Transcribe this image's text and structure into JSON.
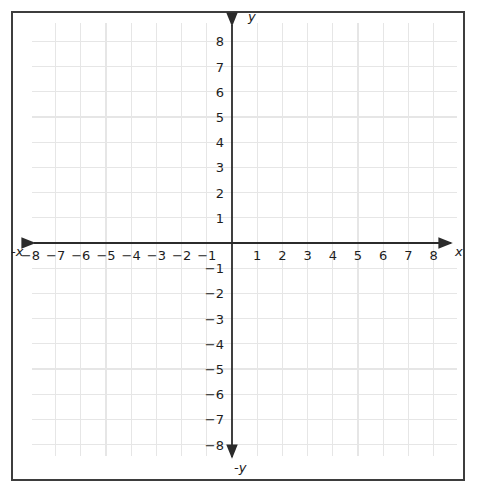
{
  "chart_data": {
    "type": "scatter",
    "title": "",
    "xlabel": "x",
    "ylabel": "y",
    "negative_xlabel": "-x",
    "negative_ylabel": "-y",
    "xlim": [
      -9,
      9
    ],
    "ylim": [
      -9,
      9
    ],
    "grid": true,
    "legend": "none",
    "series": [],
    "x_tick_labels": [
      "−8",
      "−7",
      "−6",
      "−5",
      "−4",
      "−3",
      "−2",
      "−1",
      "1",
      "2",
      "3",
      "4",
      "5",
      "6",
      "7",
      "8"
    ],
    "x_tick_values": [
      -8,
      -7,
      -6,
      -5,
      -4,
      -3,
      -2,
      -1,
      1,
      2,
      3,
      4,
      5,
      6,
      7,
      8
    ],
    "y_tick_labels": [
      "8",
      "7",
      "6",
      "5",
      "4",
      "3",
      "2",
      "1",
      "−1",
      "−2",
      "−3",
      "−4",
      "−5",
      "−6",
      "−7",
      "−8"
    ],
    "y_tick_values": [
      8,
      7,
      6,
      5,
      4,
      3,
      2,
      1,
      -1,
      -2,
      -3,
      -4,
      -5,
      -6,
      -7,
      -8
    ],
    "colors": {
      "grid": "#e6e6e6",
      "axis": "#2b2b2b",
      "border": "#3d3d3d",
      "text": "#1d1d1d",
      "background": "#ffffff"
    }
  },
  "geometry": {
    "origin_x": 232,
    "origin_y": 243,
    "cell": 25.2,
    "grid_left": 32,
    "grid_right": 457,
    "grid_top": 23,
    "grid_bottom": 456
  }
}
